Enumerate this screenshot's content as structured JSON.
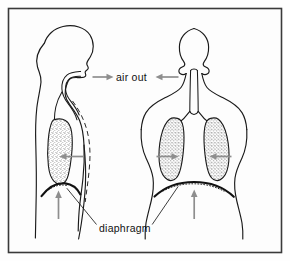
{
  "figure": {
    "background_color": "#fefefe",
    "frame_color": "#3a3a3a",
    "ink_color": "#1a1a1a",
    "arrow_color": "#8e8e8e",
    "labels": {
      "air_out": "air out",
      "diaphragm": "diaphragm"
    },
    "panels": [
      {
        "id": "side-view",
        "name": "side-profile-figure",
        "description": "Side profile of human torso and head facing right, showing one lung, trachea, and diaphragm",
        "parts": [
          "head-profile",
          "neck",
          "torso",
          "nasal-airway",
          "trachea",
          "lung-stippled",
          "chest-wall-dashed-inhaled",
          "diaphragm-dome"
        ]
      },
      {
        "id": "front-view",
        "name": "front-view-figure",
        "description": "Front view of human head, neck, shoulders and chest showing two lungs, trachea, bronchi and diaphragm",
        "parts": [
          "head",
          "neck",
          "shoulders",
          "trachea",
          "bronchi",
          "left-lung-stippled",
          "right-lung-stippled",
          "diaphragm-dome"
        ]
      }
    ],
    "arrows": [
      {
        "name": "air-out-arrow-left",
        "direction": "right",
        "meaning": "air flowing out of side-view figure airway"
      },
      {
        "name": "air-out-arrow-right",
        "direction": "left",
        "meaning": "air flowing out of front-view figure airway"
      },
      {
        "name": "lung-contract-arrow-side",
        "direction": "left",
        "meaning": "side-view lung contracting"
      },
      {
        "name": "lung-contract-arrow-front-left",
        "direction": "right",
        "meaning": "front-view left lung contracting inward"
      },
      {
        "name": "lung-contract-arrow-front-right",
        "direction": "left",
        "meaning": "front-view right lung contracting inward"
      },
      {
        "name": "diaphragm-rise-arrow-side",
        "direction": "up",
        "meaning": "diaphragm moving up in side view"
      },
      {
        "name": "diaphragm-rise-arrow-front",
        "direction": "up",
        "meaning": "diaphragm moving up in front view"
      }
    ]
  }
}
